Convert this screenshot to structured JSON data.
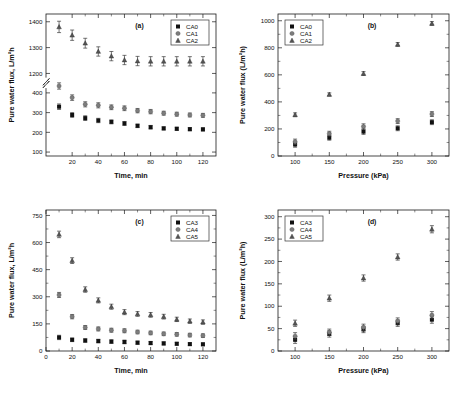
{
  "figure": {
    "panels": [
      "a",
      "b",
      "c",
      "d"
    ]
  },
  "chart_data": [
    {
      "id": "a",
      "type": "scatter",
      "panel_label": "(a)",
      "title": "",
      "xlabel": "Time, min",
      "ylabel": "Pure water flux, L/m²h",
      "xlim": [
        0,
        130
      ],
      "xticks": [
        20,
        40,
        60,
        80,
        100,
        120
      ],
      "yticks_lower": [
        100,
        200,
        300,
        400
      ],
      "yticks_upper": [
        1200,
        1300,
        1400
      ],
      "broken_axis": true,
      "break_between": [
        400,
        1200
      ],
      "grid": false,
      "legend_position": "top-right",
      "x": [
        10,
        20,
        30,
        40,
        50,
        60,
        70,
        80,
        90,
        100,
        110,
        120
      ],
      "series": [
        {
          "name": "CA0",
          "marker": "square",
          "values": [
            330,
            288,
            272,
            260,
            253,
            245,
            233,
            226,
            220,
            218,
            216,
            215
          ],
          "errors": [
            14,
            12,
            12,
            11,
            10,
            10,
            9,
            9,
            8,
            8,
            8,
            8
          ]
        },
        {
          "name": "CA1",
          "marker": "circle",
          "values": [
            435,
            376,
            342,
            337,
            327,
            322,
            310,
            305,
            297,
            292,
            288,
            286
          ],
          "errors": [
            16,
            14,
            13,
            13,
            12,
            12,
            11,
            11,
            10,
            10,
            10,
            10
          ]
        },
        {
          "name": "CA2",
          "marker": "triangle",
          "values": [
            1380,
            1348,
            1317,
            1285,
            1267,
            1252,
            1248,
            1247,
            1247,
            1247,
            1247,
            1247
          ],
          "errors": [
            22,
            20,
            19,
            18,
            18,
            18,
            18,
            18,
            18,
            18,
            18,
            18
          ]
        }
      ]
    },
    {
      "id": "b",
      "type": "scatter",
      "panel_label": "(b)",
      "title": "",
      "xlabel": "Pressure (kPa)",
      "ylabel": "Pure water flux (L/m²h)",
      "xlim": [
        75,
        325
      ],
      "xticks": [
        100,
        150,
        200,
        250,
        300
      ],
      "ylim": [
        0,
        1050
      ],
      "yticks": [
        0,
        200,
        400,
        600,
        800,
        1000
      ],
      "grid": false,
      "legend_position": "top-left",
      "x": [
        100,
        150,
        200,
        250,
        300
      ],
      "series": [
        {
          "name": "CA0",
          "marker": "square",
          "values": [
            85,
            135,
            180,
            205,
            250
          ],
          "errors": [
            20,
            18,
            20,
            18,
            18
          ]
        },
        {
          "name": "CA1",
          "marker": "circle",
          "values": [
            105,
            165,
            218,
            258,
            310
          ],
          "errors": [
            20,
            18,
            20,
            18,
            18
          ]
        },
        {
          "name": "CA2",
          "marker": "triangle",
          "values": [
            305,
            455,
            610,
            825,
            980
          ],
          "errors": [
            14,
            12,
            14,
            14,
            14
          ]
        }
      ]
    },
    {
      "id": "c",
      "type": "scatter",
      "panel_label": "(c)",
      "title": "",
      "xlabel": "Time, min",
      "ylabel": "Pure water flux, L/m²h",
      "xlim": [
        0,
        130
      ],
      "xticks": [
        0,
        20,
        40,
        60,
        80,
        100,
        120
      ],
      "ylim": [
        0,
        780
      ],
      "yticks": [
        0,
        150,
        300,
        450,
        600,
        750
      ],
      "grid": false,
      "legend_position": "top-right",
      "x": [
        10,
        20,
        30,
        40,
        50,
        60,
        70,
        80,
        90,
        100,
        110,
        120
      ],
      "series": [
        {
          "name": "CA3",
          "marker": "square",
          "values": [
            75,
            62,
            58,
            55,
            52,
            50,
            46,
            44,
            42,
            40,
            38,
            37
          ],
          "errors": [
            12,
            10,
            10,
            10,
            10,
            10,
            9,
            9,
            9,
            8,
            8,
            8
          ]
        },
        {
          "name": "CA4",
          "marker": "circle",
          "values": [
            310,
            190,
            130,
            122,
            115,
            112,
            105,
            100,
            95,
            92,
            88,
            85
          ],
          "errors": [
            14,
            12,
            11,
            11,
            11,
            11,
            10,
            10,
            10,
            10,
            10,
            10
          ]
        },
        {
          "name": "CA5",
          "marker": "triangle",
          "values": [
            645,
            500,
            340,
            280,
            245,
            215,
            205,
            200,
            190,
            175,
            165,
            160
          ],
          "errors": [
            18,
            16,
            15,
            14,
            14,
            14,
            13,
            13,
            13,
            12,
            12,
            12
          ]
        }
      ]
    },
    {
      "id": "d",
      "type": "scatter",
      "panel_label": "(d)",
      "title": "",
      "xlabel": "Pressure (kPa)",
      "ylabel": "Pure water flux (L/m²h)",
      "xlim": [
        75,
        325
      ],
      "xticks": [
        100,
        150,
        200,
        250,
        300
      ],
      "ylim": [
        0,
        315
      ],
      "yticks": [
        0,
        50,
        100,
        150,
        200,
        250,
        300
      ],
      "grid": false,
      "legend_position": "top-left",
      "x": [
        100,
        150,
        200,
        250,
        300
      ],
      "series": [
        {
          "name": "CA3",
          "marker": "square",
          "values": [
            25,
            38,
            48,
            62,
            70
          ],
          "errors": [
            8,
            7,
            7,
            7,
            8
          ]
        },
        {
          "name": "CA4",
          "marker": "circle",
          "values": [
            33,
            42,
            53,
            67,
            80
          ],
          "errors": [
            8,
            7,
            7,
            7,
            8
          ]
        },
        {
          "name": "CA5",
          "marker": "triangle",
          "values": [
            62,
            118,
            163,
            210,
            272
          ],
          "errors": [
            7,
            7,
            7,
            7,
            8
          ]
        }
      ]
    }
  ]
}
